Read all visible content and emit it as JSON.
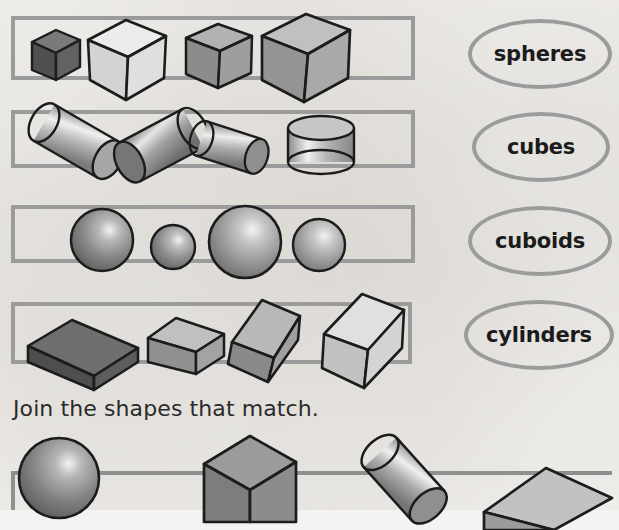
{
  "worksheet": {
    "instruction": "Join the shapes that match.",
    "background_color": "#f5f4f2",
    "outline_color": "#9b9b9b",
    "ink_color": "#1b1b1b"
  },
  "rows": [
    {
      "id": "row-cubes",
      "shape_type": "cube",
      "count": 4,
      "items": [
        {
          "name": "cube-small-dark",
          "size": "small",
          "fill": "#595959"
        },
        {
          "name": "cube-large-light",
          "size": "large",
          "fill": "#dcdcdc"
        },
        {
          "name": "cube-medium-gray",
          "size": "medium",
          "fill": "#9a9a9a"
        },
        {
          "name": "cube-xlarge-gray",
          "size": "x-large",
          "fill": "#a8a8a8"
        }
      ]
    },
    {
      "id": "row-cylinders",
      "shape_type": "cylinder",
      "count": 4,
      "items": [
        {
          "name": "cylinder-tilted-left",
          "size": "large",
          "fill": "#b4b4b4"
        },
        {
          "name": "cylinder-tilted-right",
          "size": "large",
          "fill": "#8c8c8c"
        },
        {
          "name": "cylinder-small-tilted",
          "size": "medium",
          "fill": "#9e9e9e"
        },
        {
          "name": "cylinder-upright-short",
          "size": "short",
          "fill": "#b0b0b0"
        }
      ]
    },
    {
      "id": "row-spheres",
      "shape_type": "sphere",
      "count": 4,
      "items": [
        {
          "name": "sphere-large",
          "size": "large",
          "fill": "#8a8a8a"
        },
        {
          "name": "sphere-small",
          "size": "small",
          "fill": "#8e8e8e"
        },
        {
          "name": "sphere-xlarge",
          "size": "x-large",
          "fill": "#9a9a9a"
        },
        {
          "name": "sphere-medium",
          "size": "medium",
          "fill": "#a0a0a0"
        }
      ]
    },
    {
      "id": "row-cuboids",
      "shape_type": "cuboid",
      "count": 4,
      "items": [
        {
          "name": "cuboid-dark-flat",
          "size": "large",
          "fill": "#5f5f5f"
        },
        {
          "name": "cuboid-medium",
          "size": "medium",
          "fill": "#9d9d9d"
        },
        {
          "name": "cuboid-upright",
          "size": "medium",
          "fill": "#8f8f8f"
        },
        {
          "name": "cuboid-light-tall",
          "size": "large",
          "fill": "#d2d2d2"
        }
      ]
    }
  ],
  "labels": [
    {
      "id": "label-spheres",
      "text": "spheres"
    },
    {
      "id": "label-cubes",
      "text": "cubes"
    },
    {
      "id": "label-cuboids",
      "text": "cuboids"
    },
    {
      "id": "label-cylinders",
      "text": "cylinders"
    }
  ],
  "bottom_row": {
    "id": "row-partial-bottom",
    "cropped": true,
    "items": [
      {
        "name": "sphere-bottom",
        "shape_type": "sphere",
        "fill": "#8a8a8a"
      },
      {
        "name": "cube-bottom",
        "shape_type": "cube",
        "fill": "#8f8f8f"
      },
      {
        "name": "cylinder-bottom",
        "shape_type": "cylinder",
        "fill": "#9e9e9e"
      },
      {
        "name": "cuboid-bottom",
        "shape_type": "cuboid",
        "fill": "#b6b6b6"
      }
    ]
  }
}
